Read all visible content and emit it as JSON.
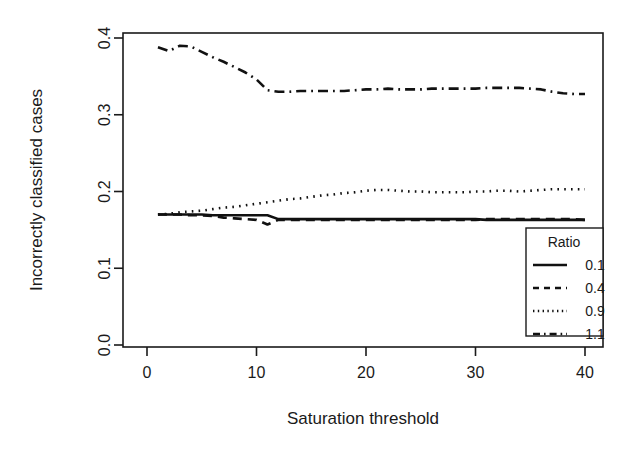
{
  "chart_data": {
    "type": "line",
    "title": "",
    "xlabel": "Saturation threshold",
    "ylabel": "Incorrectly classified cases",
    "xlim": [
      0,
      40
    ],
    "ylim": [
      0.0,
      0.4
    ],
    "grid": false,
    "legend_position": "bottom-right",
    "legend_title": "Ratio",
    "xticks": [
      0,
      10,
      20,
      30,
      40
    ],
    "xticklabels": [
      "0",
      "10",
      "20",
      "30",
      "40"
    ],
    "yticks": [
      0.0,
      0.1,
      0.2,
      0.3,
      0.4
    ],
    "yticklabels": [
      "0.0",
      "0.1",
      "0.2",
      "0.3",
      "0.4"
    ],
    "x": [
      1,
      2,
      3,
      4,
      5,
      6,
      7,
      8,
      9,
      10,
      11,
      12,
      13,
      14,
      15,
      16,
      17,
      18,
      19,
      20,
      21,
      22,
      23,
      24,
      25,
      26,
      27,
      28,
      29,
      30,
      31,
      32,
      33,
      34,
      35,
      36,
      37,
      38,
      39,
      40
    ],
    "series": [
      {
        "name": "0.1",
        "dash_style": "solid",
        "values": [
          0.17,
          0.17,
          0.17,
          0.17,
          0.17,
          0.169,
          0.169,
          0.169,
          0.169,
          0.169,
          0.169,
          0.164,
          0.164,
          0.164,
          0.164,
          0.164,
          0.164,
          0.164,
          0.164,
          0.164,
          0.164,
          0.164,
          0.164,
          0.164,
          0.164,
          0.164,
          0.164,
          0.164,
          0.164,
          0.164,
          0.163,
          0.163,
          0.163,
          0.163,
          0.163,
          0.163,
          0.163,
          0.163,
          0.163,
          0.163
        ]
      },
      {
        "name": "0.4",
        "dash_style": "dashed",
        "values": [
          0.17,
          0.17,
          0.17,
          0.169,
          0.169,
          0.168,
          0.166,
          0.165,
          0.164,
          0.163,
          0.157,
          0.163,
          0.163,
          0.163,
          0.163,
          0.163,
          0.163,
          0.163,
          0.163,
          0.163,
          0.163,
          0.163,
          0.163,
          0.163,
          0.163,
          0.163,
          0.163,
          0.163,
          0.163,
          0.163,
          0.164,
          0.164,
          0.164,
          0.164,
          0.164,
          0.164,
          0.164,
          0.164,
          0.164,
          0.163
        ]
      },
      {
        "name": "0.9",
        "dash_style": "dotted",
        "values": [
          0.17,
          0.171,
          0.173,
          0.174,
          0.175,
          0.177,
          0.179,
          0.18,
          0.182,
          0.184,
          0.186,
          0.188,
          0.19,
          0.191,
          0.193,
          0.195,
          0.196,
          0.198,
          0.199,
          0.201,
          0.202,
          0.202,
          0.201,
          0.2,
          0.2,
          0.199,
          0.199,
          0.199,
          0.199,
          0.2,
          0.2,
          0.201,
          0.201,
          0.2,
          0.201,
          0.202,
          0.203,
          0.203,
          0.203,
          0.203
        ]
      },
      {
        "name": "1.1",
        "dash_style": "dashdot",
        "values": [
          0.388,
          0.383,
          0.39,
          0.389,
          0.382,
          0.375,
          0.369,
          0.362,
          0.355,
          0.346,
          0.332,
          0.33,
          0.33,
          0.331,
          0.331,
          0.331,
          0.331,
          0.331,
          0.332,
          0.333,
          0.333,
          0.334,
          0.333,
          0.333,
          0.333,
          0.334,
          0.334,
          0.334,
          0.334,
          0.334,
          0.335,
          0.335,
          0.335,
          0.335,
          0.334,
          0.333,
          0.33,
          0.328,
          0.327,
          0.327
        ]
      }
    ]
  },
  "colors": {
    "line": "#111111",
    "axis": "#1a1a1a",
    "background": "#ffffff"
  }
}
